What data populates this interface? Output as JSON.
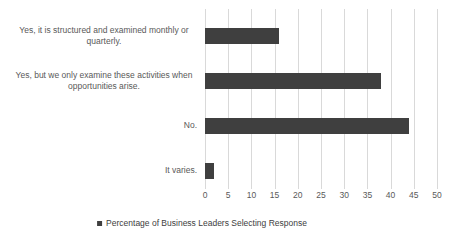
{
  "chart_data": {
    "type": "bar",
    "orientation": "horizontal",
    "categories": [
      "Yes, it is structured and examined monthly or quarterly.",
      "Yes, but we only examine these activities when opportunities arise.",
      "No.",
      "It varies."
    ],
    "series": [
      {
        "name": "Percentage of Business Leaders Selecting Response",
        "values": [
          16,
          38,
          44,
          2
        ]
      }
    ],
    "xlim": [
      0,
      50
    ],
    "x_ticks": [
      0,
      5,
      10,
      15,
      20,
      25,
      30,
      35,
      40,
      45,
      50
    ],
    "grid": "vertical-only",
    "legend_position": "bottom",
    "legend_label": "Percentage of Business Leaders Selecting Response",
    "colors": {
      "bar": "#3f3f3f",
      "gridline": "#d9d9d9",
      "axis_text": "#595959",
      "legend_text": "#404040",
      "background": "#ffffff"
    }
  }
}
